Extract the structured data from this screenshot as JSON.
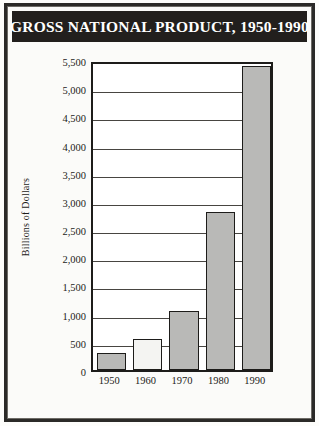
{
  "figure": {
    "title": "GROSS NATIONAL PRODUCT, 1950-1990"
  },
  "chart_data": {
    "type": "bar",
    "title": "GROSS NATIONAL PRODUCT, 1950-1990",
    "xlabel": "",
    "ylabel": "Billions of Dollars",
    "categories": [
      "1950",
      "1960",
      "1970",
      "1980",
      "1990"
    ],
    "values": [
      300,
      550,
      1050,
      2800,
      5400
    ],
    "ylim": [
      0,
      5500
    ],
    "ytick_labels": [
      "0",
      "500",
      "1,000",
      "1,500",
      "2,000",
      "2,500",
      "3,000",
      "3,500",
      "4,000",
      "4,500",
      "5,000",
      "5,500"
    ],
    "ytick_values": [
      0,
      500,
      1000,
      1500,
      2000,
      2500,
      3000,
      3500,
      4000,
      4500,
      5000,
      5500
    ],
    "grid": true,
    "legend": "none",
    "bar_colors": [
      "#b9b9b7",
      "#f4f4f2",
      "#b9b9b7",
      "#b9b9b7",
      "#b9b9b7"
    ],
    "bar_edge_color": "#1d1c1a",
    "title_background": "#221f1d",
    "title_color": "#ffffff",
    "plot_background": "#ffffff",
    "figure_background": "#fbfbf9",
    "frame_color": "#2b2a28"
  }
}
